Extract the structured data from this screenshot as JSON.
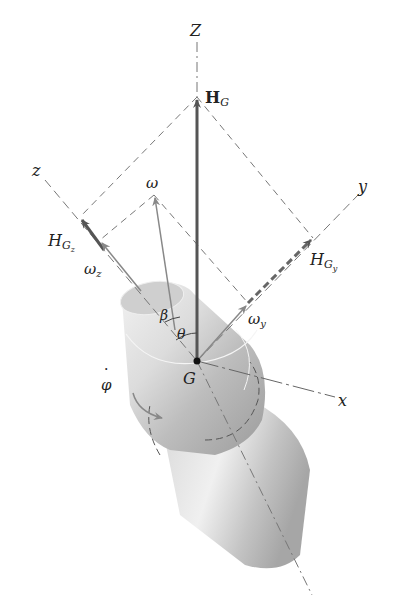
{
  "figure": {
    "type": "rigid-body-dynamics diagram"
  },
  "labels": {
    "Z_axis": "Z",
    "z_axis": "z",
    "y_axis": "y",
    "x_axis": "x",
    "H_G": "H",
    "H_G_sub": "G",
    "H_Gz": "H",
    "H_Gz_sub": "G",
    "H_Gz_subsub": "z",
    "H_Gy": "H",
    "H_Gy_sub": "G",
    "H_Gy_subsub": "y",
    "omega": "ω",
    "omega_z": "ω",
    "omega_z_sub": "z",
    "omega_y": "ω",
    "omega_y_sub": "y",
    "beta": "β",
    "theta": "θ",
    "center_G": "G",
    "phi_dot": "φ",
    "phi_dot_dot": "·"
  },
  "colors": {
    "axis_dash": "#777777",
    "vector_dark": "#555555",
    "vector_light": "#888888",
    "body_light": "#eeeeee",
    "body_mid": "#c8c8c8",
    "body_dark": "#9a9a9a",
    "text": "#222222"
  }
}
